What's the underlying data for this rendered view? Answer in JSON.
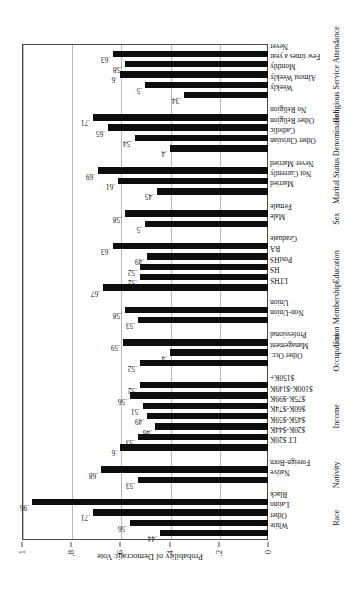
{
  "chart_data": {
    "type": "bar",
    "title": "",
    "xlabel": "",
    "ylabel": "Probability of Democratic Vote",
    "ylim": [
      0,
      1
    ],
    "grid": true,
    "legend": "none",
    "orientation": "vertical-bars-on-rotated-page",
    "ytick_labels": [
      "0",
      ".2",
      ".4",
      ".6",
      ".8",
      "1"
    ],
    "ytick_values": [
      0,
      0.2,
      0.4,
      0.6,
      0.8,
      1
    ],
    "categories": [
      "White",
      "Other",
      "Latino",
      "Black",
      "Native",
      "Foreign-Born",
      "LT $20K",
      "$20K-$44K",
      "$45K-$59K",
      "$60K-$74K",
      "$75K-$99K",
      "$100K-$149K",
      "$150K+",
      "Other Occ.",
      "Management",
      "Professional",
      "Non-Union",
      "Union",
      "LTHS",
      "HS",
      "PostHS",
      "BA",
      "Graduate",
      "Male",
      "Female",
      "Married",
      "Not Currently",
      "Never Married",
      "Other Christian",
      "Catholic",
      "Other Religion",
      "No Religion",
      "Weekly",
      "Almost Weekly",
      "Monthly",
      "Few times a year",
      "Never"
    ],
    "values": [
      0.44,
      0.56,
      0.71,
      0.96,
      0.53,
      0.68,
      0.6,
      0.53,
      0.46,
      0.49,
      0.51,
      0.56,
      0.52,
      0.52,
      0.4,
      0.59,
      0.53,
      0.58,
      0.67,
      0.52,
      0.52,
      0.49,
      0.63,
      0.5,
      0.58,
      0.45,
      0.61,
      0.69,
      0.4,
      0.54,
      0.65,
      0.71,
      0.34,
      0.5,
      0.6,
      0.58,
      0.63
    ],
    "value_labels": [
      ".44",
      ".56",
      ".71",
      ".96",
      ".53",
      ".68",
      ".6",
      ".53",
      ".46",
      ".49",
      ".51",
      ".56",
      ".52",
      ".52",
      ".4",
      ".59",
      ".53",
      ".58",
      ".67",
      ".52",
      ".52",
      ".49",
      ".63",
      ".5",
      ".58",
      ".45",
      ".61",
      ".69",
      ".4",
      ".54",
      ".65",
      ".71",
      ".34",
      ".5",
      ".6",
      ".58",
      ".63"
    ],
    "groups": [
      {
        "label": "Race",
        "start": 0,
        "count": 4
      },
      {
        "label": "Nativity",
        "start": 4,
        "count": 2
      },
      {
        "label": "Income",
        "start": 6,
        "count": 7
      },
      {
        "label": "Occupation",
        "start": 13,
        "count": 3
      },
      {
        "label": "Union Membership",
        "start": 16,
        "count": 2
      },
      {
        "label": "Education",
        "start": 18,
        "count": 5
      },
      {
        "label": "Sex",
        "start": 23,
        "count": 2
      },
      {
        "label": "Marital Status",
        "start": 25,
        "count": 3
      },
      {
        "label": "Denomination",
        "start": 28,
        "count": 4
      },
      {
        "label": "Religious Service Attendance",
        "start": 32,
        "count": 5
      }
    ],
    "bar_color": "#0d0d0d",
    "grid_color": "#b9b9b9",
    "axis_color": "#4a4a4a"
  }
}
